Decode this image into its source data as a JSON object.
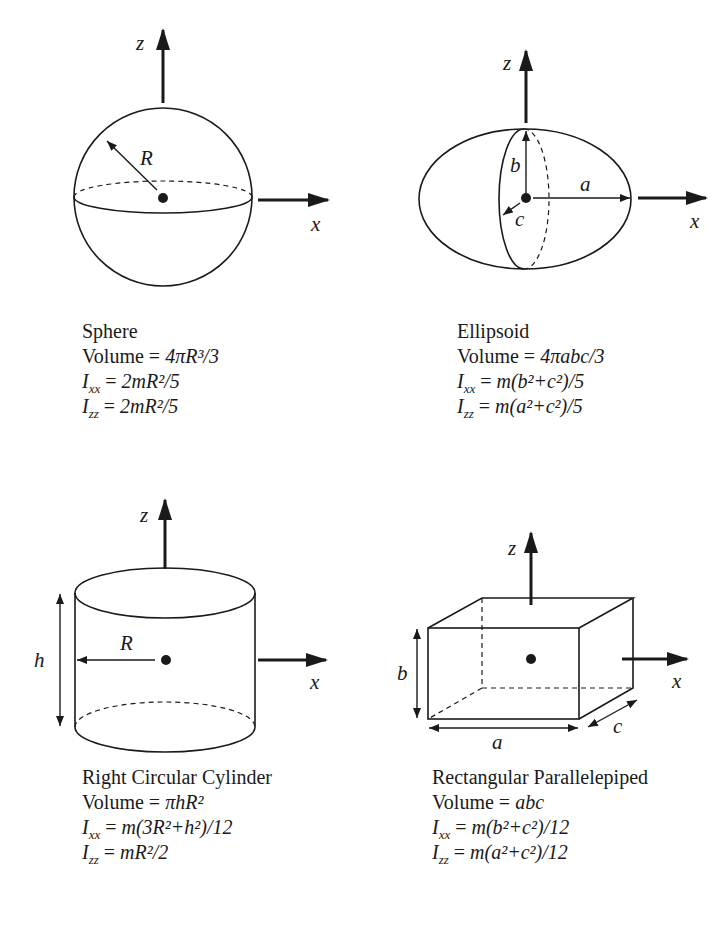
{
  "figure": {
    "axes": {
      "x": "x",
      "z": "z"
    },
    "colors": {
      "stroke": "#1a1a1a",
      "background": "#ffffff"
    }
  },
  "shapes": [
    {
      "name": "Sphere",
      "title": "Sphere",
      "dimension_labels": {
        "R": "R"
      },
      "volume": {
        "label": "Volume",
        "expr": "4πR³/3"
      },
      "Ixx": "2mR²/5",
      "Izz": "2mR²/5"
    },
    {
      "name": "Ellipsoid",
      "title": "Ellipsoid",
      "dimension_labels": {
        "a": "a",
        "b": "b",
        "c": "c"
      },
      "volume": {
        "label": "Volume",
        "expr": "4πabc/3"
      },
      "Ixx": "m(b²+c²)/5",
      "Izz": "m(a²+c²)/5"
    },
    {
      "name": "Right Circular Cylinder",
      "title": "Right Circular Cylinder",
      "dimension_labels": {
        "R": "R",
        "h": "h"
      },
      "volume": {
        "label": "Volume",
        "expr": "πhR²"
      },
      "Ixx": "m(3R²+h²)/12",
      "Izz": "mR²/2"
    },
    {
      "name": "Rectangular Parallelepiped",
      "title": "Rectangular Parallelepiped",
      "dimension_labels": {
        "a": "a",
        "b": "b",
        "c": "c"
      },
      "volume": {
        "label": "Volume",
        "expr": "abc"
      },
      "Ixx": "m(b²+c²)/12",
      "Izz": "m(a²+c²)/12"
    }
  ]
}
